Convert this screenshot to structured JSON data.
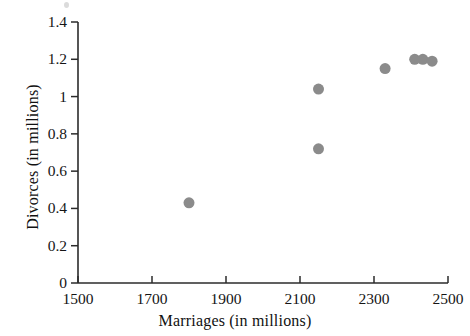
{
  "chart_data": {
    "type": "scatter",
    "title": "",
    "xlabel": "Marriages (in millions)",
    "ylabel": "Divorces (in millions)",
    "xlim": [
      1500,
      2500
    ],
    "ylim": [
      0,
      1.4
    ],
    "xticks": [
      1500,
      1700,
      1900,
      2100,
      2300,
      2500
    ],
    "xtick_labels": [
      "1500",
      "1700",
      "1900",
      "2100",
      "2300",
      "2500"
    ],
    "yticks": [
      0,
      0.2,
      0.4,
      0.6,
      0.8,
      1,
      1.2,
      1.4
    ],
    "ytick_labels": [
      "0",
      "0.2",
      "0.4",
      "0.6",
      "0.8",
      "1",
      "1.2",
      "1.4"
    ],
    "grid": false,
    "legend": "none",
    "marker": {
      "shape": "circle",
      "color": "#8b8b8b",
      "size_px": 11
    },
    "axis_color": "#2b2b2b",
    "points": [
      {
        "x": 1800,
        "y": 0.43
      },
      {
        "x": 2150,
        "y": 1.04
      },
      {
        "x": 2150,
        "y": 0.72
      },
      {
        "x": 2330,
        "y": 1.15
      },
      {
        "x": 2410,
        "y": 1.2
      },
      {
        "x": 2432,
        "y": 1.2
      },
      {
        "x": 2457,
        "y": 1.19
      }
    ]
  }
}
